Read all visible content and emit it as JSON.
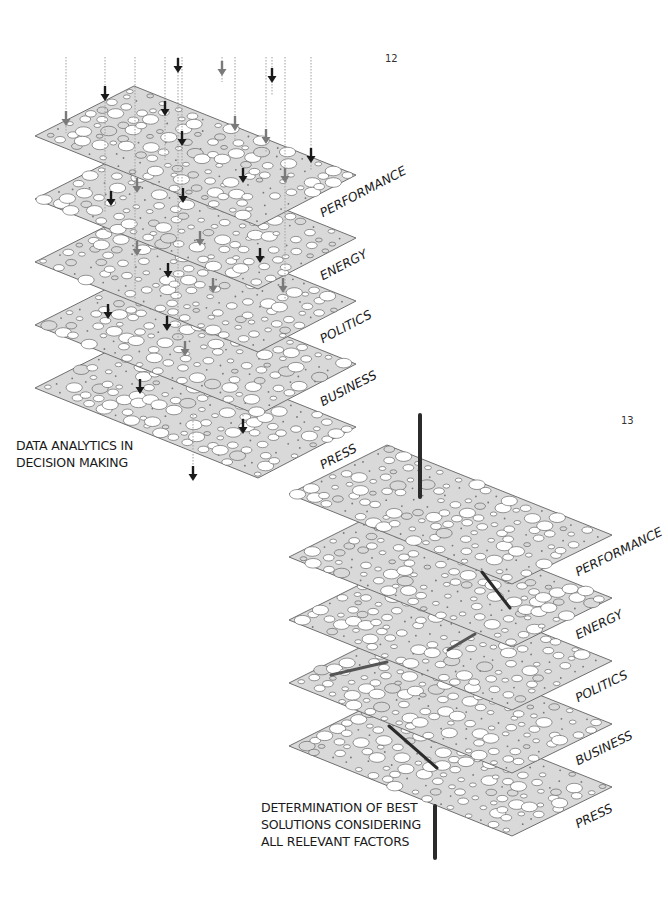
{
  "colors": {
    "plane_fill": "#d9d9d9",
    "plane_stroke": "#6f6f6f",
    "hole_fill": "#ffffff",
    "hole_stroke": "#555555",
    "arrow_dark": "#1a1a1a",
    "arrow_gray": "#7a7a7a",
    "dotted_line": "#a0a0a0",
    "connector": "#2b2b2b",
    "connector_gray": "#555555"
  },
  "diagram_12": {
    "page_number": "12",
    "caption": [
      "DATA ANALYTICS IN",
      "DECISION MAKING"
    ],
    "origin": {
      "left": [
        35,
        136
      ],
      "top": [
        134,
        86
      ],
      "right": [
        356,
        175
      ],
      "bottom": [
        258,
        226
      ]
    },
    "layer_spacing": 63,
    "layers": [
      {
        "label": "PERFORMANCE"
      },
      {
        "label": "ENERGY"
      },
      {
        "label": "POLITICS"
      },
      {
        "label": "BUSINESS"
      },
      {
        "label": "PRESS"
      }
    ],
    "dotted_lines": [
      {
        "x": 66,
        "y1": 57,
        "y2": 133
      },
      {
        "x": 105,
        "y1": 57,
        "y2": 213
      },
      {
        "x": 135,
        "y1": 57,
        "y2": 300
      },
      {
        "x": 165,
        "y1": 57,
        "y2": 160
      },
      {
        "x": 178,
        "y1": 57,
        "y2": 340
      },
      {
        "x": 182,
        "y1": 57,
        "y2": 200
      },
      {
        "x": 222,
        "y1": 57,
        "y2": 82
      },
      {
        "x": 235,
        "y1": 57,
        "y2": 140
      },
      {
        "x": 266,
        "y1": 57,
        "y2": 152
      },
      {
        "x": 272,
        "y1": 57,
        "y2": 95
      },
      {
        "x": 285,
        "y1": 57,
        "y2": 300
      },
      {
        "x": 311,
        "y1": 57,
        "y2": 170
      },
      {
        "x": 193,
        "y1": 415,
        "y2": 470
      },
      {
        "x": 243,
        "y1": 415,
        "y2": 430
      }
    ],
    "arrows": [
      {
        "x": 178,
        "y": 72,
        "tone": "dark"
      },
      {
        "x": 222,
        "y": 75,
        "tone": "gray"
      },
      {
        "x": 272,
        "y": 82,
        "tone": "dark"
      },
      {
        "x": 105,
        "y": 100,
        "tone": "dark"
      },
      {
        "x": 66,
        "y": 125,
        "tone": "gray"
      },
      {
        "x": 165,
        "y": 115,
        "tone": "dark"
      },
      {
        "x": 182,
        "y": 145,
        "tone": "dark"
      },
      {
        "x": 235,
        "y": 130,
        "tone": "gray"
      },
      {
        "x": 266,
        "y": 143,
        "tone": "gray"
      },
      {
        "x": 311,
        "y": 162,
        "tone": "dark"
      },
      {
        "x": 243,
        "y": 182,
        "tone": "dark"
      },
      {
        "x": 285,
        "y": 182,
        "tone": "gray"
      },
      {
        "x": 137,
        "y": 192,
        "tone": "gray"
      },
      {
        "x": 111,
        "y": 205,
        "tone": "dark"
      },
      {
        "x": 183,
        "y": 202,
        "tone": "dark"
      },
      {
        "x": 200,
        "y": 245,
        "tone": "gray"
      },
      {
        "x": 137,
        "y": 255,
        "tone": "gray"
      },
      {
        "x": 260,
        "y": 262,
        "tone": "dark"
      },
      {
        "x": 168,
        "y": 277,
        "tone": "dark"
      },
      {
        "x": 213,
        "y": 292,
        "tone": "gray"
      },
      {
        "x": 283,
        "y": 292,
        "tone": "gray"
      },
      {
        "x": 108,
        "y": 318,
        "tone": "dark"
      },
      {
        "x": 167,
        "y": 330,
        "tone": "dark"
      },
      {
        "x": 185,
        "y": 355,
        "tone": "gray"
      },
      {
        "x": 140,
        "y": 393,
        "tone": "dark"
      },
      {
        "x": 243,
        "y": 433,
        "tone": "dark"
      },
      {
        "x": 193,
        "y": 480,
        "tone": "dark"
      }
    ]
  },
  "diagram_13": {
    "page_number": "13",
    "caption": [
      "DETERMINATION OF BEST",
      "SOLUTIONS CONSIDERING",
      "ALL RELEVANT FACTORS"
    ],
    "origin": {
      "left": [
        289,
        494
      ],
      "top": [
        387,
        445
      ],
      "right": [
        612,
        535
      ],
      "bottom": [
        512,
        584
      ]
    },
    "layer_spacing": 63,
    "layers": [
      {
        "label": "PERFORMANCE"
      },
      {
        "label": "ENERGY"
      },
      {
        "label": "POLITICS"
      },
      {
        "label": "BUSINESS"
      },
      {
        "label": "PRESS"
      }
    ],
    "connectors": [
      {
        "x1": 420,
        "y1": 415,
        "x2": 420,
        "y2": 497,
        "tone": "dark",
        "width": 4
      },
      {
        "x1": 482,
        "y1": 572,
        "x2": 510,
        "y2": 608,
        "tone": "dark",
        "width": 3
      },
      {
        "x1": 448,
        "y1": 650,
        "x2": 475,
        "y2": 634,
        "tone": "gray",
        "width": 3
      },
      {
        "x1": 331,
        "y1": 675,
        "x2": 387,
        "y2": 662,
        "tone": "gray",
        "width": 3
      },
      {
        "x1": 389,
        "y1": 726,
        "x2": 437,
        "y2": 768,
        "tone": "dark",
        "width": 3
      },
      {
        "x1": 435,
        "y1": 806,
        "x2": 435,
        "y2": 858,
        "tone": "dark",
        "width": 4
      }
    ]
  }
}
